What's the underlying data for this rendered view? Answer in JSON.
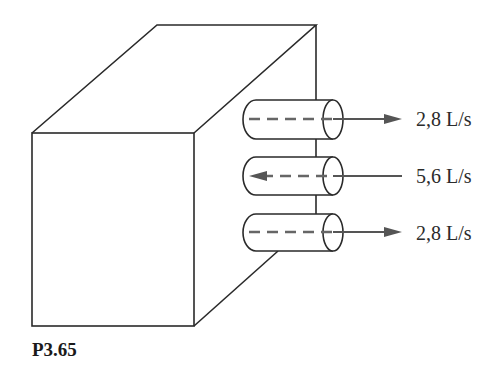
{
  "figure": {
    "caption": "P3.65",
    "object": "box-tank",
    "pipes": [
      {
        "position": "top",
        "direction": "out",
        "label": "2,8 L/s"
      },
      {
        "position": "middle",
        "direction": "in",
        "label": "5,6 L/s"
      },
      {
        "position": "bottom",
        "direction": "out",
        "label": "2,8 L/s"
      }
    ]
  }
}
